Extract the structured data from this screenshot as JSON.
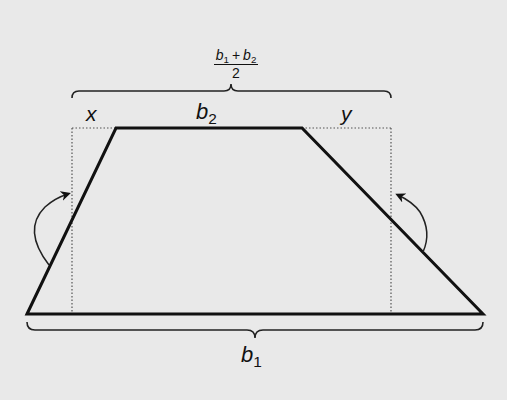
{
  "diagram": {
    "background": "#e9e9e9",
    "stroke_color": "#111111",
    "labels": {
      "top_fraction_numerator_b": "b",
      "top_fraction_sub1": "1",
      "top_fraction_plus": "+",
      "top_fraction_b2": "b",
      "top_fraction_sub2": "2",
      "top_fraction_denominator": "2",
      "x": "x",
      "b2_base": "b",
      "b2_sub": "2",
      "y": "y",
      "b1_base": "b",
      "b1_sub": "1"
    },
    "shapes": {
      "trapezoid_vertices": [
        [
          27,
          314
        ],
        [
          116,
          128
        ],
        [
          302,
          128
        ],
        [
          483,
          314
        ]
      ],
      "dotted_rectangle": {
        "left": 72,
        "top": 128,
        "right": 391,
        "bottom": 314
      },
      "top_brace": {
        "x1": 72,
        "x2": 391,
        "y": 92
      },
      "bottom_brace": {
        "x1": 27,
        "x2": 483,
        "y": 330
      },
      "rotation_arrows": [
        "left-counterclockwise",
        "right-counterclockwise"
      ]
    }
  }
}
